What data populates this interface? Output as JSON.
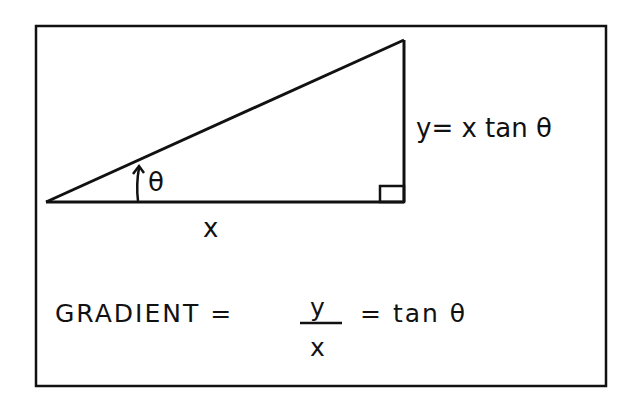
{
  "diagram": {
    "colors": {
      "ink": "#111111",
      "background": "#ffffff"
    },
    "labels": {
      "angle": "θ",
      "base": "x",
      "height": "y= x tan θ"
    },
    "formula": {
      "lhs": "GRADIENT =",
      "numerator": "y",
      "denominator": "x",
      "rhs": "= tan θ"
    }
  }
}
